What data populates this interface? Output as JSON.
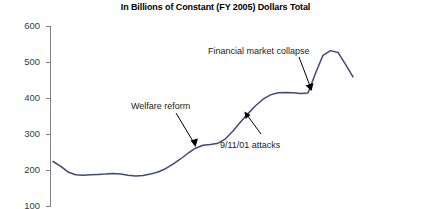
{
  "chart_data": {
    "type": "line",
    "title": "In Billions of Constant (FY 2005) Dollars Total",
    "xlabel": "",
    "ylabel": "",
    "ylim": [
      100,
      600
    ],
    "yticks": [
      600,
      500,
      400,
      300,
      200,
      100
    ],
    "ytick_labels": [
      "600",
      "500",
      "400",
      "300",
      "200",
      "100"
    ],
    "grid": false,
    "legend": null,
    "axis_color": "#808080",
    "series": [
      {
        "name": "Total spending",
        "color": "#3d4a7a",
        "values": [
          225,
          212,
          196,
          188,
          187,
          188,
          189,
          190,
          192,
          190,
          187,
          185,
          186,
          190,
          196,
          205,
          218,
          232,
          248,
          262,
          270,
          272,
          276,
          288,
          310,
          335,
          358,
          380,
          398,
          410,
          416,
          417,
          416,
          414,
          415,
          470,
          520,
          533,
          528,
          495,
          460
        ]
      }
    ],
    "annotations": [
      {
        "id": "welfare-reform",
        "label": "Welfare reform",
        "arrow": "points down-right to line"
      },
      {
        "id": "nine-eleven-attacks",
        "label": "9/11/01 attacks",
        "arrow": "points up-left to line"
      },
      {
        "id": "financial-market-collapse",
        "label": "Financial market collapse",
        "arrow": "points down to line"
      }
    ]
  }
}
